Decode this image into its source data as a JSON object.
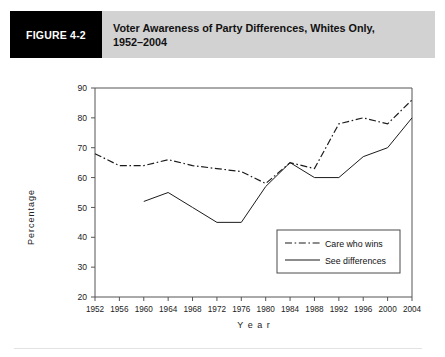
{
  "figure": {
    "number_label": "FIGURE 4-2",
    "title_line1": "Voter Awareness of Party Differences, Whites Only,",
    "title_line2": "1952–2004"
  },
  "chart_data": {
    "type": "line",
    "title": "Voter Awareness of Party Differences, Whites Only, 1952–2004",
    "xlabel": "Y e a r",
    "ylabel": "Percentage",
    "ylim": [
      20,
      90
    ],
    "xlim": [
      1952,
      2004
    ],
    "grid": false,
    "legend_position": "bottom-right",
    "categories": [
      "1952",
      "1956",
      "1960",
      "1964",
      "1968",
      "1972",
      "1976",
      "1980",
      "1984",
      "1988",
      "1992",
      "1996",
      "2000",
      "2004"
    ],
    "x": [
      1952,
      1956,
      1960,
      1964,
      1968,
      1972,
      1976,
      1980,
      1984,
      1988,
      1992,
      1996,
      2000,
      2004
    ],
    "yticks": [
      20,
      30,
      40,
      50,
      60,
      70,
      80,
      90
    ],
    "series": [
      {
        "name": "Care who wins",
        "style": "dash-dot",
        "color": "#1b1b1b",
        "x": [
          1952,
          1956,
          1960,
          1964,
          1968,
          1972,
          1976,
          1980,
          1984,
          1988,
          1992,
          1996,
          2000,
          2004
        ],
        "values": [
          68,
          64,
          64,
          66,
          64,
          63,
          62,
          58,
          65,
          63,
          78,
          80,
          78,
          86
        ]
      },
      {
        "name": "See differences",
        "style": "solid",
        "color": "#1b1b1b",
        "x": [
          1960,
          1964,
          1968,
          1972,
          1976,
          1980,
          1984,
          1988,
          1992,
          1996,
          2000,
          2004
        ],
        "values": [
          52,
          55,
          50,
          45,
          45,
          57,
          65,
          60,
          60,
          67,
          70,
          80
        ]
      }
    ]
  },
  "legend": {
    "items": [
      {
        "label": "Care who wins",
        "style": "dash-dot"
      },
      {
        "label": "See differences",
        "style": "solid"
      }
    ]
  }
}
